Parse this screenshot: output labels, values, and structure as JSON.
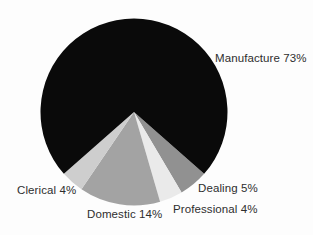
{
  "chart_data": {
    "type": "pie",
    "title": "",
    "background": "#fdfdfd",
    "text_color": "#2e2e2e",
    "slices": [
      {
        "name": "Dealing",
        "value": 5,
        "color": "#919191",
        "label": "Dealing 5%",
        "label_x": 198,
        "label_y": 182
      },
      {
        "name": "Professional",
        "value": 4,
        "color": "#eaeaea",
        "label": "Professional 4%",
        "label_x": 173,
        "label_y": 203
      },
      {
        "name": "Domestic",
        "value": 14,
        "color": "#a3a3a3",
        "label": "Domestic 14%",
        "label_x": 87,
        "label_y": 208
      },
      {
        "name": "Clerical",
        "value": 4,
        "color": "#cecece",
        "label": "Clerical 4%",
        "label_x": 17,
        "label_y": 184
      },
      {
        "name": "Manufacture",
        "value": 73,
        "color": "#0a0a0a",
        "label": "Manufacture 73%",
        "label_x": 215,
        "label_y": 52
      }
    ],
    "layout": {
      "center": {
        "x": 134,
        "y": 112
      },
      "radius": 93.5,
      "start_angle_deg_clockwise_from_top": 131.4,
      "direction": "clockwise",
      "legend": "none",
      "labels": "outside-anchored"
    }
  }
}
